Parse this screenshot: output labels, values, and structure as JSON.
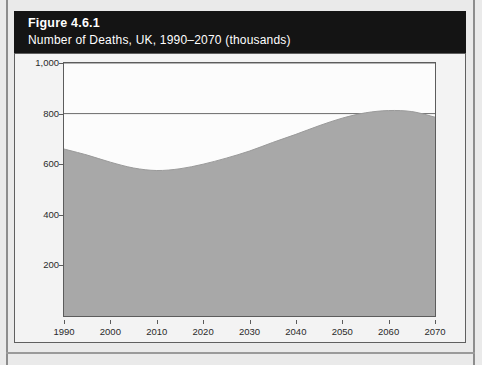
{
  "figure": {
    "title": "Figure 4.6.1",
    "subtitle": "Number of Deaths, UK, 1990–2070 (thousands)"
  },
  "colors": {
    "header_bg": "#141414",
    "header_text": "#ffffff",
    "page_bg": "#eaeaea",
    "card_bg": "#f3f3f3",
    "plot_bg": "#fcfcfc",
    "area_fill": "#a8a8a8",
    "axis": "#5c5c5c",
    "grid": "#6a6a6a"
  },
  "chart_data": {
    "type": "area",
    "title": "Number of Deaths, UK, 1990–2070 (thousands)",
    "xlabel": "",
    "ylabel": "",
    "xlim": [
      1990,
      2070
    ],
    "ylim": [
      0,
      1000
    ],
    "grid": true,
    "grid_lines": [
      800,
      1000
    ],
    "legend": "none",
    "xticklabels": [
      "1990",
      "2000",
      "2010",
      "2020",
      "2030",
      "2040",
      "2050",
      "2060",
      "2070"
    ],
    "yticklabels": [
      "200",
      "400",
      "600",
      "800",
      "1,000"
    ],
    "yticks": [
      200,
      400,
      600,
      800,
      1000
    ],
    "xticks": [
      1990,
      2000,
      2010,
      2020,
      2030,
      2040,
      2050,
      2060,
      2070
    ],
    "x": [
      1990,
      1995,
      2000,
      2005,
      2010,
      2015,
      2020,
      2025,
      2030,
      2035,
      2040,
      2045,
      2050,
      2055,
      2060,
      2065,
      2070
    ],
    "values": [
      660,
      636,
      608,
      585,
      575,
      582,
      600,
      624,
      652,
      686,
      718,
      752,
      782,
      803,
      812,
      808,
      786
    ],
    "series": [
      {
        "name": "Number of deaths",
        "values": [
          660,
          636,
          608,
          585,
          575,
          582,
          600,
          624,
          652,
          686,
          718,
          752,
          782,
          803,
          812,
          808,
          786
        ]
      }
    ]
  }
}
